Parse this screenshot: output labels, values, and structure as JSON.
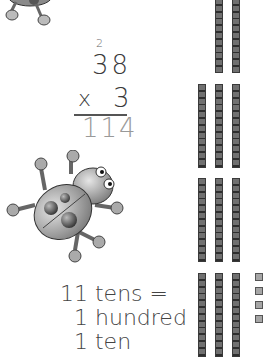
{
  "problem": {
    "carry": "2",
    "multiplicand": "38",
    "operator": "x",
    "multiplier": "3",
    "product": "114"
  },
  "explanation": {
    "line1": "11 tens =",
    "line2": "1 hundred",
    "line3": "1 ten"
  },
  "base_ten_blocks": {
    "groups": [
      {
        "rods": 2,
        "note": "partially visible, top"
      },
      {
        "rods": 3
      },
      {
        "rods": 3
      },
      {
        "rods": 3,
        "units": 4
      }
    ]
  },
  "illustrations": [
    "ladybug-robot-top",
    "ladybug-robot-middle"
  ],
  "colors": {
    "rod": "#6a6a6a",
    "unit_cube": "#a6a6a6",
    "answer_digits": "#999999"
  }
}
